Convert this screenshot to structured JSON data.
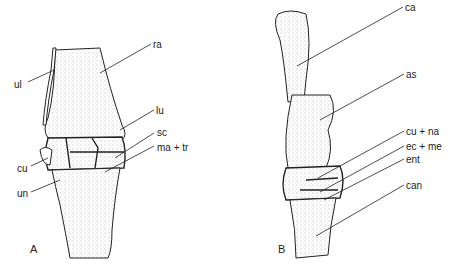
{
  "figure": {
    "panels": [
      {
        "id": "A",
        "label": "A",
        "parts": [
          {
            "abbr": "ul",
            "x": 14,
            "y": 80
          },
          {
            "abbr": "ra",
            "x": 153,
            "y": 40
          },
          {
            "abbr": "lu",
            "x": 156,
            "y": 106
          },
          {
            "abbr": "sc",
            "x": 157,
            "y": 128
          },
          {
            "abbr": "ma + tr",
            "x": 157,
            "y": 143
          },
          {
            "abbr": "cu",
            "x": 17,
            "y": 164
          },
          {
            "abbr": "un",
            "x": 17,
            "y": 189
          }
        ]
      },
      {
        "id": "B",
        "label": "B",
        "parts": [
          {
            "abbr": "ca",
            "x": 405,
            "y": 3
          },
          {
            "abbr": "as",
            "x": 406,
            "y": 70
          },
          {
            "abbr": "cu + na",
            "x": 406,
            "y": 127
          },
          {
            "abbr": "ec + me",
            "x": 406,
            "y": 142
          },
          {
            "abbr": "ent",
            "x": 406,
            "y": 155
          },
          {
            "abbr": "can",
            "x": 406,
            "y": 181
          }
        ]
      }
    ]
  },
  "colors": {
    "ink": "#222222",
    "stipple": "#9a9a9a",
    "background": "#ffffff"
  }
}
